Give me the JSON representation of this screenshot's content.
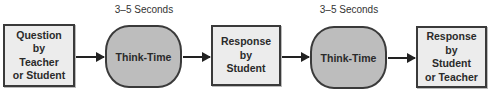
{
  "diagram": {
    "type": "flowchart",
    "nodes": [
      {
        "id": "question",
        "shape": "rectangle",
        "lines": [
          "Question",
          "by",
          "Teacher",
          "or Student"
        ]
      },
      {
        "id": "think1",
        "shape": "rounded",
        "label": "Think-Time",
        "time_label": "3–5 Seconds"
      },
      {
        "id": "response1",
        "shape": "rectangle",
        "lines": [
          "Response",
          "by",
          "Student"
        ]
      },
      {
        "id": "think2",
        "shape": "rounded",
        "label": "Think-Time",
        "time_label": "3–5 Seconds"
      },
      {
        "id": "response2",
        "shape": "rectangle",
        "lines": [
          "Response",
          "by",
          "Student",
          "or Teacher"
        ]
      }
    ],
    "edges": [
      {
        "from": "question",
        "to": "think1"
      },
      {
        "from": "think1",
        "to": "response1"
      },
      {
        "from": "response1",
        "to": "think2"
      },
      {
        "from": "think2",
        "to": "response2"
      }
    ],
    "colors": {
      "box_fill": "#ececec",
      "pill_fill": "#bdbdbd",
      "stroke": "#3a3a3a"
    }
  }
}
